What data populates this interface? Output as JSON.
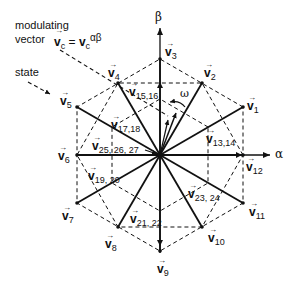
{
  "annotations": {
    "modulating_line1": "modulating",
    "modulating_line2": "vector",
    "modulating_formula_lhs": "v",
    "modulating_formula_lhs_sub": "c",
    "modulating_formula_eq": "=",
    "modulating_formula_rhs": "v",
    "modulating_formula_rhs_sub": "c",
    "modulating_formula_sup": "αβ",
    "state": "state",
    "omega": "ω"
  },
  "axes": {
    "alpha": "α",
    "beta": "β"
  },
  "vectors": {
    "v1": {
      "name": "v",
      "sub": "1"
    },
    "v2": {
      "name": "v",
      "sub": "2"
    },
    "v3": {
      "name": "v",
      "sub": "3"
    },
    "v4": {
      "name": "v",
      "sub": "4"
    },
    "v5": {
      "name": "v",
      "sub": "5"
    },
    "v6": {
      "name": "v",
      "sub": "6"
    },
    "v7": {
      "name": "v",
      "sub": "7"
    },
    "v8": {
      "name": "v",
      "sub": "8"
    },
    "v9": {
      "name": "v",
      "sub": "9"
    },
    "v10": {
      "name": "v",
      "sub": "10"
    },
    "v11": {
      "name": "v",
      "sub": "11"
    },
    "v12": {
      "name": "v",
      "sub": "12"
    },
    "v13_14": {
      "name": "v",
      "sub": "13,14"
    },
    "v15_16": {
      "name": "v",
      "sub": "15,16"
    },
    "v17_18": {
      "name": "v",
      "sub": "17,18"
    },
    "v19_20": {
      "name": "v",
      "sub": "19, 20"
    },
    "v21_22": {
      "name": "v",
      "sub": "21, 22"
    },
    "v23_24": {
      "name": "v",
      "sub": "23, 24"
    },
    "v25_26_27": {
      "name": "v",
      "sub": "25, 26, 27"
    }
  },
  "arrow_glyph": "→",
  "colors": {
    "ink": "#111111",
    "background": "#ffffff"
  }
}
